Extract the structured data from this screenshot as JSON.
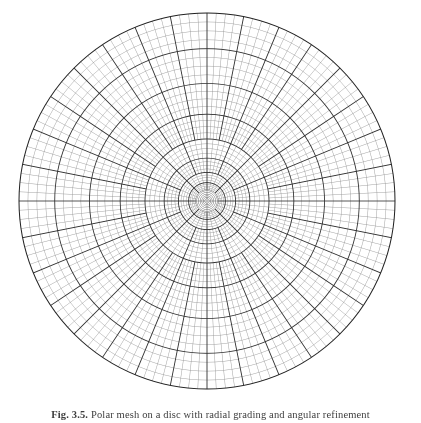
{
  "page": {
    "width": 421,
    "height": 423,
    "background": "#ffffff"
  },
  "figure": {
    "kind": "polar-refined-mesh",
    "caption_label": "Fig. 3.5.",
    "caption_text": "Polar mesh on a disc with radial grading and angular refinement"
  },
  "chart_data": {
    "type": "mesh",
    "title": "",
    "xlabel": "",
    "ylabel": "",
    "grid": true,
    "legend": false,
    "geometry": {
      "shape": "disc",
      "center_x": 207,
      "center_y": 201,
      "outer_radius": 188,
      "core_radius": 11.5
    },
    "colors": {
      "background": "#ffffff",
      "coarse_line": "#2e2e2e",
      "fine_line": "#8a8a8a",
      "core_line": "#555555",
      "outer_boundary": "#1f1f1f"
    },
    "line_widths": {
      "coarse": 0.85,
      "fine": 0.4,
      "core": 0.45,
      "boundary": 1.0
    },
    "radial": {
      "description": "Ring radii as a fraction of the outer radius. Spacing is geometric: tight near the centre, coarse near the rim.",
      "block_ring_fractions": [
        0.061,
        0.098,
        0.152,
        0.228,
        0.33,
        0.462,
        0.625,
        0.81,
        1.0
      ],
      "fine_subdivisions_per_block": 4
    },
    "angular": {
      "description": "Number of radial spokes used in each annular block, doubling outward as the mesh refines.",
      "block_spoke_counts": [
        32,
        32,
        64,
        64,
        128,
        128,
        128,
        128
      ],
      "coarse_spoke_counts": [
        8,
        8,
        16,
        16,
        32,
        32,
        32,
        32
      ]
    },
    "core": {
      "description": "Innermost core region drawn only with concentric circles and a pair of crossing axes.",
      "circle_fractions": [
        0.012,
        0.02,
        0.028,
        0.037,
        0.046,
        0.055,
        0.061
      ],
      "axes": [
        "horizontal",
        "vertical"
      ]
    }
  }
}
